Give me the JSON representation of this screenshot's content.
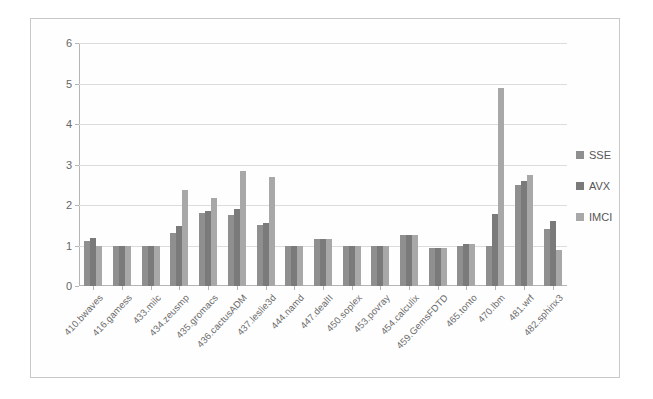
{
  "chart_data": {
    "type": "bar",
    "title": "",
    "subtitle": "",
    "xlabel": "",
    "ylabel": "",
    "ylim": [
      0,
      6
    ],
    "ytick_labels": [
      "0",
      "1",
      "2",
      "3",
      "4",
      "5",
      "6"
    ],
    "ytick_values": [
      0,
      1,
      2,
      3,
      4,
      5,
      6
    ],
    "grid": true,
    "legend_position": "right",
    "categories": [
      "410.bwaves",
      "416.gamess",
      "433.milc",
      "434.zeusmp",
      "435.gromacs",
      "436.cactusADM",
      "437.leslie3d",
      "444.namd",
      "447.dealII",
      "450.soplex",
      "453.povray",
      "454.calculix",
      "459.GemsFDTD",
      "465.tonto",
      "470.lbm",
      "481.wrf",
      "482.sphinx3"
    ],
    "series": [
      {
        "name": "SSE",
        "color": "#8f8f8f",
        "values": [
          1.1,
          1.0,
          1.0,
          1.3,
          1.8,
          1.75,
          1.5,
          1.0,
          1.15,
          1.0,
          1.0,
          1.25,
          0.95,
          1.0,
          1.0,
          2.5,
          1.4
        ]
      },
      {
        "name": "AVX",
        "color": "#7a7a7a",
        "values": [
          1.18,
          1.0,
          1.0,
          1.48,
          1.85,
          1.9,
          1.55,
          1.0,
          1.15,
          1.0,
          1.0,
          1.25,
          0.95,
          1.03,
          1.78,
          2.6,
          1.6
        ]
      },
      {
        "name": "IMCI",
        "color": "#a8a8a8",
        "values": [
          1.0,
          1.0,
          1.0,
          2.38,
          2.18,
          2.83,
          2.68,
          1.0,
          1.15,
          1.0,
          1.0,
          1.25,
          0.95,
          1.03,
          4.9,
          2.75,
          0.88
        ]
      }
    ]
  },
  "legend": {
    "items": [
      {
        "label": "SSE",
        "key": "sse"
      },
      {
        "label": "AVX",
        "key": "avx"
      },
      {
        "label": "IMCI",
        "key": "imci"
      }
    ]
  }
}
